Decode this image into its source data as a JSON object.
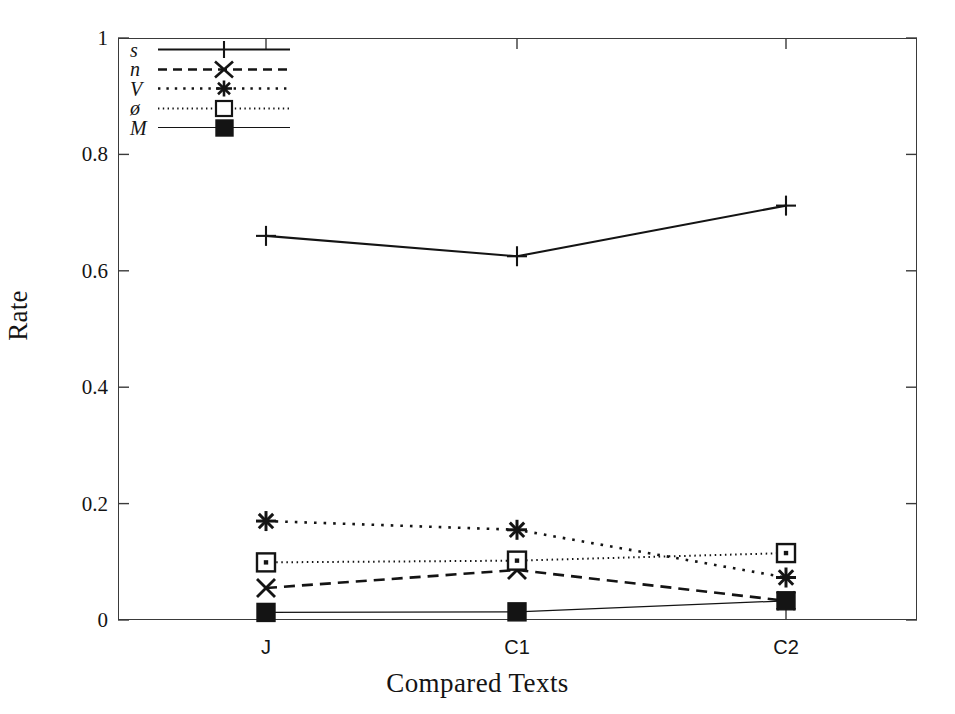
{
  "chart_data": {
    "type": "line",
    "title": "",
    "xlabel": "Compared Texts",
    "ylabel": "Rate",
    "categories": [
      "J",
      "C1",
      "C2"
    ],
    "ylim": [
      0,
      1
    ],
    "yticks": [
      "0",
      "0.2",
      "0.4",
      "0.6",
      "0.8",
      "1"
    ],
    "ytick_values": [
      0,
      0.2,
      0.4,
      0.6,
      0.8,
      1
    ],
    "grid": false,
    "legend_position": "top-left-inside",
    "series": [
      {
        "name": "s",
        "marker": "plus",
        "line_style": "solid",
        "values": [
          0.66,
          0.625,
          0.712
        ]
      },
      {
        "name": "n",
        "marker": "cross",
        "line_style": "dashed",
        "values": [
          0.055,
          0.086,
          0.033
        ]
      },
      {
        "name": "V",
        "marker": "asterisk",
        "line_style": "dotted",
        "values": [
          0.17,
          0.155,
          0.073
        ]
      },
      {
        "name": "ø",
        "marker": "open-square",
        "line_style": "fine-dotted",
        "values": [
          0.099,
          0.102,
          0.115
        ]
      },
      {
        "name": "M",
        "marker": "filled-square",
        "line_style": "solid-thin",
        "values": [
          0.013,
          0.014,
          0.033
        ]
      }
    ]
  },
  "colors": {
    "ink": "#141414",
    "axis": "#3a3a3a",
    "background": "#ffffff"
  }
}
